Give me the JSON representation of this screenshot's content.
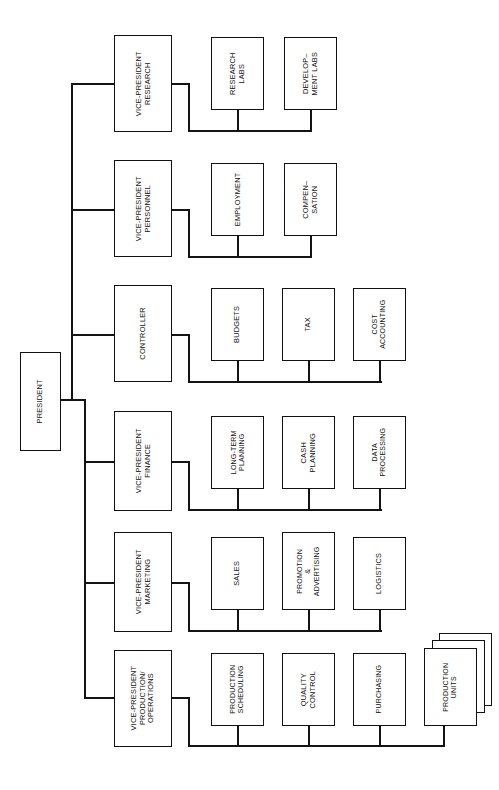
{
  "diagram": {
    "orientation": "rotated-90-ccw",
    "line_color": "#141414",
    "box_border_color": "#111111",
    "background": "#ffffff"
  },
  "root": {
    "label": "PRESIDENT"
  },
  "branches": [
    {
      "id": "research",
      "label": "VICE-PRESIDENT\nRESEARCH",
      "line1": "VICE-PRESIDENT",
      "line2": "RESEARCH",
      "children": [
        {
          "id": "research-labs",
          "line1": "RESEARCH",
          "line2": "LABS"
        },
        {
          "id": "development-labs",
          "line1": "DEVELOP–",
          "line2": "MENT LABS"
        }
      ]
    },
    {
      "id": "personnel",
      "label": "VICE-PRESIDENT\nPERSONNEL",
      "line1": "VICE-PRESIDENT",
      "line2": "PERSONNEL",
      "children": [
        {
          "id": "employment",
          "line1": "EMPLOYMENT",
          "line2": ""
        },
        {
          "id": "compensation",
          "line1": "COMPEN–",
          "line2": "SATION"
        }
      ]
    },
    {
      "id": "controller",
      "label": "CONTROLLER",
      "line1": "CONTROLLER",
      "line2": "",
      "children": [
        {
          "id": "budgets",
          "line1": "BUDGETS",
          "line2": ""
        },
        {
          "id": "tax",
          "line1": "TAX",
          "line2": ""
        },
        {
          "id": "cost-accounting",
          "line1": "COST",
          "line2": "ACCOUNTING"
        }
      ]
    },
    {
      "id": "finance",
      "label": "VICE-PRESIDENT\nFINANCE",
      "line1": "VICE-PRESIDENT",
      "line2": "FINANCE",
      "children": [
        {
          "id": "long-term-planning",
          "line1": "LONG-TERM",
          "line2": "PLANNING"
        },
        {
          "id": "cash-planning",
          "line1": "CASH",
          "line2": "PLANNING"
        },
        {
          "id": "data-processing",
          "line1": "DATA",
          "line2": "PROCESSING"
        }
      ]
    },
    {
      "id": "marketing",
      "label": "VICE-PRESIDENT\nMARKETING",
      "line1": "VICE-PRESIDENT",
      "line2": "MARKETING",
      "children": [
        {
          "id": "sales",
          "line1": "SALES",
          "line2": ""
        },
        {
          "id": "promotion-advertising",
          "line1": "PROMOTION",
          "line2": "&",
          "line3": "ADVERTISING"
        },
        {
          "id": "logistics",
          "line1": "LOGISTICS",
          "line2": ""
        }
      ]
    },
    {
      "id": "production-operations",
      "label": "VICE-PRESIDENT\nPRODUCTION/\nOPERATIONS",
      "line1": "VICE-PRESIDENT",
      "line2": "PRODUCTION/",
      "line3": "OPERATIONS",
      "children": [
        {
          "id": "production-scheduling",
          "line1": "PRODUCTION",
          "line2": "SCHEDULING"
        },
        {
          "id": "quality-control",
          "line1": "QUALITY",
          "line2": "CONTROL"
        },
        {
          "id": "purchasing",
          "line1": "PURCHASING",
          "line2": ""
        },
        {
          "id": "production-units",
          "line1": "PRODUCTION",
          "line2": "UNITS",
          "stacked": true,
          "stack_count": 3
        }
      ]
    }
  ]
}
